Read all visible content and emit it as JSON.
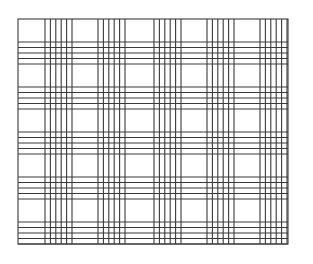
{
  "pattern": {
    "type": "plaid-grid",
    "line_color": "#3a3a3a",
    "line_width": 1.1,
    "background": "#ffffff",
    "frame": {
      "left": 18,
      "top": 19,
      "right": 288,
      "bottom": 244
    },
    "vertical_groups_start": [
      45,
      98,
      154,
      207,
      260
    ],
    "vertical_lines_per_group": 6,
    "vertical_spacing": 5.4,
    "horizontal_groups_start": [
      42,
      87,
      132,
      177,
      222
    ],
    "horizontal_lines_per_group": 5,
    "horizontal_spacing": 5.5
  }
}
